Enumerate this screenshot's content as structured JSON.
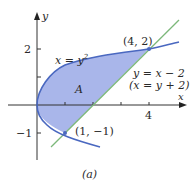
{
  "figure": {
    "caption": "(a)",
    "axes": {
      "x_label": "x",
      "y_label": "y",
      "x_ticks": [
        {
          "value": 1,
          "label": ""
        },
        {
          "value": 2,
          "label": ""
        },
        {
          "value": 3,
          "label": ""
        },
        {
          "value": 4,
          "label": "4"
        }
      ],
      "y_ticks": [
        {
          "value": 2,
          "label": "2"
        },
        {
          "value": 1,
          "label": ""
        },
        {
          "value": -1,
          "label": "−1"
        }
      ]
    },
    "curves": {
      "parabola": {
        "label_left": "x = y",
        "label_exp": "2",
        "equation": "x = y^2",
        "color": "#4a68c0"
      },
      "line": {
        "label1": "y = x − 2",
        "label2": "(x = y + 2)",
        "color": "#7cb87a"
      }
    },
    "region": {
      "label": "A",
      "fill": "#9aa9e6"
    },
    "points": [
      {
        "label": "(4, 2)",
        "x": 4,
        "y": 2
      },
      {
        "label": "(1, −1)",
        "x": 1,
        "y": -1
      }
    ]
  }
}
